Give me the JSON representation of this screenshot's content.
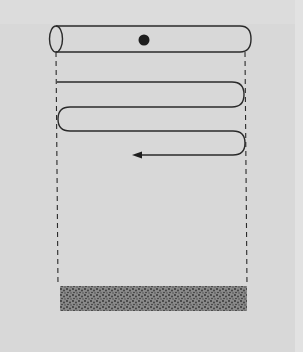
{
  "figure": {
    "type": "diagram",
    "colors": {
      "background": "#d8d8d8",
      "line": "#2a2a2a",
      "particle": "#1e1e1e",
      "sediment": "#5a5a5a"
    },
    "elements": {
      "tube": {
        "x1": 50,
        "x2": 250,
        "y_top": 26,
        "y_bottom": 52
      },
      "particle": {
        "cx": 144,
        "cy": 40,
        "r": 5
      },
      "guide_lines": {
        "left_x": 57,
        "right_x": 246,
        "y_top": 52,
        "y_bottom": 286,
        "style": "dashed"
      },
      "serpentine_path": {
        "rows_y": [
          82,
          107,
          131,
          155
        ],
        "arrow_tip_x": 132,
        "direction": "left"
      },
      "sediment_layer": {
        "x": 60,
        "y": 286,
        "width": 187,
        "height": 25
      }
    }
  }
}
